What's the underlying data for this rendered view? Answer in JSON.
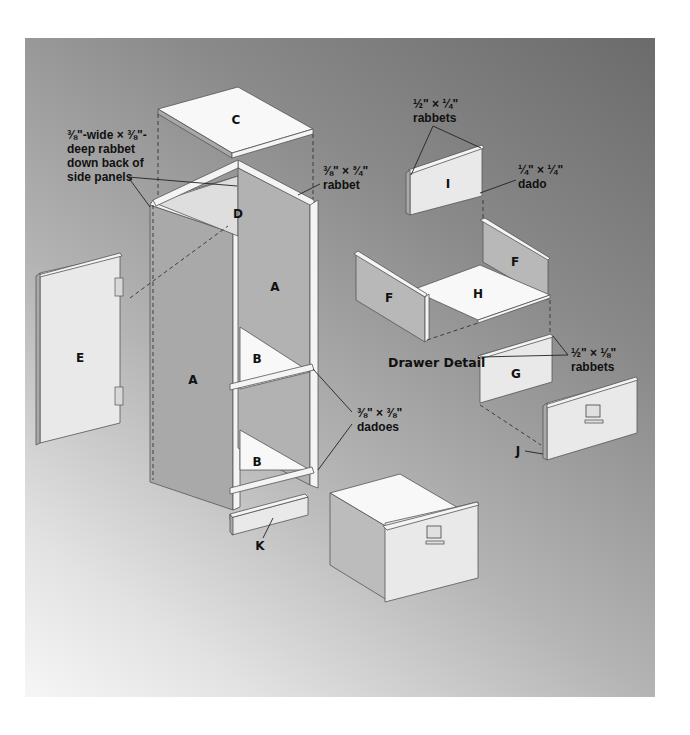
{
  "figure": {
    "background": {
      "top_right": "#6b6b6b",
      "bottom_left": "#f6f6f6"
    }
  },
  "parts": {
    "A": "A",
    "B": "B",
    "C": "C",
    "D": "D",
    "E": "E",
    "F": "F",
    "G": "G",
    "H": "H",
    "I": "I",
    "J": "J",
    "K": "K"
  },
  "annotations": {
    "side_rabbet": [
      "⅜\"-wide × ⅜\"-",
      "deep rabbet",
      "down back of",
      "side panels"
    ],
    "top_rabbet": [
      "⅜\" × ¾\"",
      "rabbet"
    ],
    "dadoes": [
      "⅜\" × ⅜\"",
      "dadoes"
    ],
    "drawer_back_rabbets": [
      "½\" × ¼\"",
      "rabbets"
    ],
    "drawer_back_dado": [
      "¼\" × ¼\"",
      "dado"
    ],
    "drawer_front_rabbets": [
      "½\" × ⅛\"",
      "rabbets"
    ],
    "drawer_detail_title": "Drawer Detail"
  }
}
